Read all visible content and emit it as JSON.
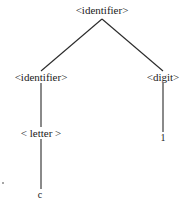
{
  "diagram": {
    "type": "parse-tree",
    "line_color": "#2a2a2a",
    "text_color": "#1a1a1a",
    "background": "#ffffff",
    "nodes": {
      "root": {
        "label": "<identifier>",
        "x": 102,
        "y": 5
      },
      "left_identifier": {
        "label": "<identifier>",
        "x": 41,
        "y": 72
      },
      "digit": {
        "label": "<digit>",
        "x": 163,
        "y": 72
      },
      "letter": {
        "label": "< letter >",
        "x": 41,
        "y": 128
      },
      "digit_leaf": {
        "label": "1",
        "x": 163,
        "y": 133
      },
      "letter_leaf": {
        "label": "c",
        "x": 40,
        "y": 190
      }
    },
    "edges": [
      {
        "from": "root",
        "to": "left_identifier",
        "x1": 102,
        "y1": 19,
        "x2": 41,
        "y2": 71
      },
      {
        "from": "root",
        "to": "digit",
        "x1": 102,
        "y1": 19,
        "x2": 163,
        "y2": 71
      },
      {
        "from": "left_identifier",
        "to": "letter",
        "x1": 41,
        "y1": 83,
        "x2": 41,
        "y2": 127
      },
      {
        "from": "letter",
        "to": "letter_leaf",
        "x1": 41,
        "y1": 139,
        "x2": 41,
        "y2": 189
      },
      {
        "from": "digit",
        "to": "digit_leaf",
        "x1": 163,
        "y1": 83,
        "x2": 163,
        "y2": 132
      }
    ],
    "artifacts": [
      {
        "x": 2,
        "y": 182
      }
    ]
  }
}
